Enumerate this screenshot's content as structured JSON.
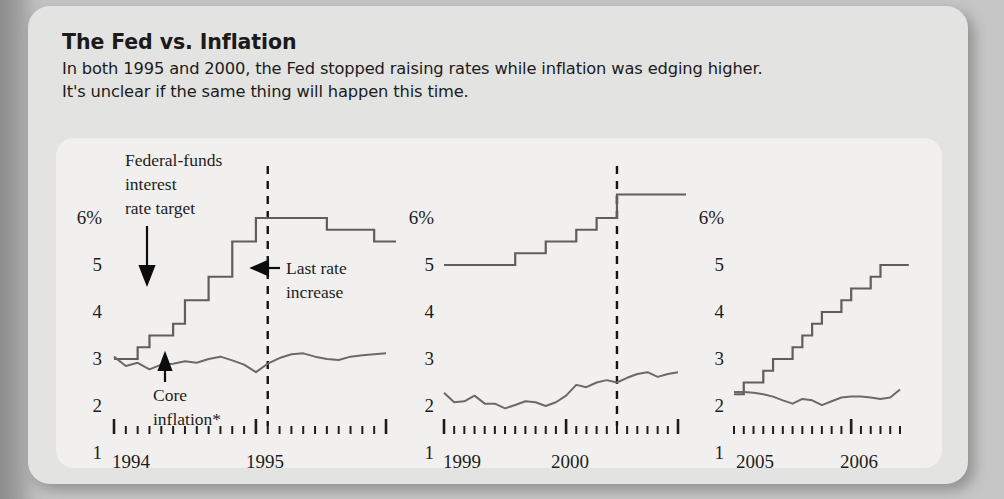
{
  "header": {
    "title": "The Fed vs. Inflation",
    "deck_line_1": "In both 1995 and 2000, the Fed stopped raising rates while inflation was edging higher.",
    "deck_line_2": "It's unclear if the same thing will happen this time."
  },
  "colors": {
    "page_background": "#8e8e8e",
    "card_background": "#e3e3e1",
    "plot_background": "#f1f0ee",
    "line_color": "#5e5e5e",
    "text_color": "#1a1a1a",
    "marker_color": "#141414"
  },
  "annotations": {
    "fed_funds_label_line_1": "Federal-funds",
    "fed_funds_label_line_2": "interest",
    "fed_funds_label_line_3": "rate target",
    "core_inflation_line_1": "Core",
    "core_inflation_line_2": "inflation*",
    "last_rate_line_1": "Last rate",
    "last_rate_line_2": "increase"
  },
  "axis": {
    "y_ticks": [
      "6%",
      "5",
      "4",
      "3",
      "2",
      "1"
    ],
    "y_values": [
      6,
      5,
      4,
      3,
      2,
      1
    ],
    "y_min": 1,
    "y_max": 6.55
  },
  "chart_data": [
    {
      "type": "line",
      "title": "The Fed vs. Inflation",
      "panel": 1,
      "xlabel": "",
      "ylabel": "",
      "ylim": [
        1,
        6.55
      ],
      "grid": false,
      "legend_position": "annotated-inline",
      "x_tick_labels": [
        "1994",
        "1995"
      ],
      "x_tick_label_positions": [
        0,
        12
      ],
      "x_major_ticks": [
        0,
        12,
        23
      ],
      "x_minor_count": 24,
      "event_marker": {
        "label": "Last rate increase",
        "x_index": 13
      },
      "series": [
        {
          "name": "Federal-funds interest rate target",
          "style": "step",
          "x": [
            0,
            1,
            2,
            3,
            4,
            5,
            6,
            7,
            8,
            9,
            10,
            11,
            12,
            13,
            14,
            15,
            16,
            17,
            18,
            19,
            20,
            21,
            22,
            23
          ],
          "values": [
            3.0,
            3.0,
            3.25,
            3.5,
            3.5,
            3.75,
            4.25,
            4.25,
            4.75,
            4.75,
            5.5,
            5.5,
            6.0,
            6.0,
            6.0,
            6.0,
            6.0,
            6.0,
            5.75,
            5.75,
            5.75,
            5.75,
            5.5,
            5.5
          ]
        },
        {
          "name": "Core inflation*",
          "style": "line",
          "x": [
            0,
            1,
            2,
            3,
            4,
            5,
            6,
            7,
            8,
            9,
            10,
            11,
            12,
            13,
            14,
            15,
            16,
            17,
            18,
            19,
            20,
            21,
            22,
            23
          ],
          "values": [
            3.05,
            2.85,
            2.92,
            2.78,
            2.88,
            2.9,
            2.95,
            2.92,
            3.0,
            3.05,
            2.97,
            2.88,
            2.72,
            2.9,
            3.02,
            3.1,
            3.12,
            3.05,
            3.0,
            2.98,
            3.05,
            3.08,
            3.1,
            3.12
          ]
        }
      ]
    },
    {
      "type": "line",
      "panel": 2,
      "xlabel": "",
      "ylabel": "",
      "ylim": [
        1,
        6.55
      ],
      "grid": false,
      "x_tick_labels": [
        "1999",
        "2000"
      ],
      "x_tick_label_positions": [
        0,
        12
      ],
      "x_major_ticks": [
        0,
        12,
        23
      ],
      "x_minor_count": 24,
      "event_marker": {
        "label": "Last rate increase",
        "x_index": 17
      },
      "series": [
        {
          "name": "Federal-funds interest rate target",
          "style": "step",
          "x": [
            0,
            1,
            2,
            3,
            4,
            5,
            6,
            7,
            8,
            9,
            10,
            11,
            12,
            13,
            14,
            15,
            16,
            17,
            18,
            19,
            20,
            21,
            22,
            23
          ],
          "values": [
            5.0,
            5.0,
            5.0,
            5.0,
            5.0,
            5.0,
            5.0,
            5.25,
            5.25,
            5.25,
            5.5,
            5.5,
            5.5,
            5.75,
            5.75,
            6.0,
            6.0,
            6.5,
            6.5,
            6.5,
            6.5,
            6.5,
            6.5,
            6.5
          ]
        },
        {
          "name": "Core inflation*",
          "style": "line",
          "x": [
            0,
            1,
            2,
            3,
            4,
            5,
            6,
            7,
            8,
            9,
            10,
            11,
            12,
            13,
            14,
            15,
            16,
            17,
            18,
            19,
            20,
            21,
            22,
            23
          ],
          "values": [
            2.28,
            2.08,
            2.1,
            2.22,
            2.05,
            2.05,
            1.95,
            2.02,
            2.1,
            2.08,
            2.0,
            2.08,
            2.22,
            2.45,
            2.4,
            2.5,
            2.55,
            2.5,
            2.6,
            2.68,
            2.72,
            2.62,
            2.68,
            2.72
          ]
        }
      ]
    },
    {
      "type": "line",
      "panel": 3,
      "xlabel": "",
      "ylabel": "",
      "ylim": [
        1,
        6.55
      ],
      "grid": false,
      "x_tick_labels": [
        "2005",
        "2006"
      ],
      "x_tick_label_positions": [
        0,
        12
      ],
      "x_major_ticks": [
        12
      ],
      "x_minor_count": 18,
      "event_marker": null,
      "series": [
        {
          "name": "Federal-funds interest rate target",
          "style": "step",
          "x": [
            0,
            1,
            2,
            3,
            4,
            5,
            6,
            7,
            8,
            9,
            10,
            11,
            12,
            13,
            14,
            15,
            16,
            17
          ],
          "values": [
            2.25,
            2.5,
            2.5,
            2.75,
            3.0,
            3.0,
            3.25,
            3.5,
            3.75,
            4.0,
            4.0,
            4.25,
            4.5,
            4.5,
            4.75,
            5.0,
            5.0,
            5.0
          ]
        },
        {
          "name": "Core inflation*",
          "style": "line",
          "x": [
            0,
            1,
            2,
            3,
            4,
            5,
            6,
            7,
            8,
            9,
            10,
            11,
            12,
            13,
            14,
            15,
            16,
            17
          ],
          "values": [
            2.3,
            2.3,
            2.28,
            2.25,
            2.2,
            2.12,
            2.05,
            2.15,
            2.12,
            2.02,
            2.1,
            2.18,
            2.2,
            2.2,
            2.18,
            2.15,
            2.18,
            2.35
          ]
        }
      ]
    }
  ]
}
